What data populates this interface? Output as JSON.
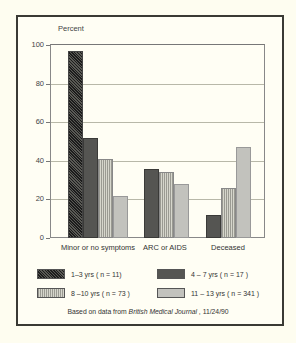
{
  "chart_data": {
    "type": "bar",
    "title": "",
    "ylabel": "Percent",
    "xlabel": "",
    "ylim": [
      0,
      100
    ],
    "yticks": [
      0,
      20,
      40,
      60,
      80,
      100
    ],
    "grid": true,
    "legend_position": "bottom",
    "categories": [
      "Minor or no symptoms",
      "ARC or AIDS",
      "Deceased"
    ],
    "series": [
      {
        "name": "1–3 yrs ( n = 11)",
        "pattern": "black-hatch",
        "values": [
          97,
          0,
          0
        ]
      },
      {
        "name": "4 – 7 yrs ( n = 17 )",
        "pattern": "dark-gray",
        "values": [
          52,
          36,
          12
        ]
      },
      {
        "name": "8 –10 yrs ( n = 73 )",
        "pattern": "gray-lines",
        "values": [
          41,
          34,
          26
        ]
      },
      {
        "name": "11 – 13 yrs ( n = 341 )",
        "pattern": "dotted",
        "values": [
          22,
          28,
          47
        ]
      }
    ],
    "source_prefix": "Based on data from ",
    "source_journal": "British Medical Journal",
    "source_suffix": " , 11/24/90"
  }
}
